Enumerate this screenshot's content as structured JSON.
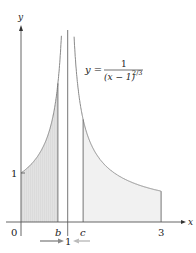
{
  "chart_data": {
    "type": "area",
    "title": "",
    "equation": {
      "lhs": "y =",
      "numerator": "1",
      "denominator": "(x − 1)",
      "exponent": "2/3"
    },
    "xlabel": "x",
    "ylabel": "y",
    "function": "1/(x-1)^(2/3)",
    "vertical_asymptote": 1,
    "x_ticks": [
      {
        "value": 0,
        "label": "0"
      },
      {
        "value": 0.79,
        "label": "b"
      },
      {
        "value": 1.33,
        "label": "c"
      },
      {
        "value": 3,
        "label": "3"
      }
    ],
    "y_ticks": [
      {
        "value": 1,
        "label": "1"
      }
    ],
    "asymptote_label": "1",
    "shaded_regions": [
      {
        "name": "left",
        "x_from": 0,
        "x_to": 0.79,
        "style": "hatched",
        "fill": "#d9d9d9"
      },
      {
        "name": "right",
        "x_from": 1.33,
        "x_to": 3,
        "style": "light",
        "fill": "#f1f1f1"
      }
    ],
    "sample_points": [
      {
        "x": 0,
        "y": 1.0
      },
      {
        "x": 0.5,
        "y": 1.59
      },
      {
        "x": 0.79,
        "y": 2.83
      },
      {
        "x": 1.33,
        "y": 2.09
      },
      {
        "x": 2,
        "y": 1.0
      },
      {
        "x": 3,
        "y": 0.63
      }
    ],
    "xlim": [
      0,
      3.3
    ],
    "ylim": [
      0,
      4.1
    ],
    "grid": false,
    "legend": null,
    "colors": {
      "curve": "#8a8a8a",
      "axis": "#555555",
      "arrow": "#9a9a9a"
    }
  }
}
